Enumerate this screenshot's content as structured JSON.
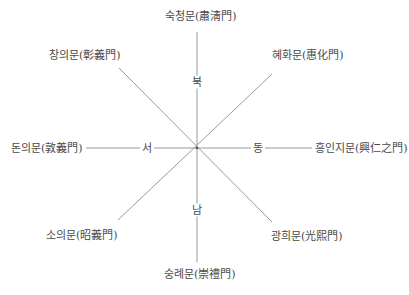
{
  "diagram": {
    "title": "",
    "line_color": "#9a9a9a",
    "center": {
      "x": 197,
      "y": 148
    },
    "directions": {
      "north": "북",
      "south": "남",
      "east": "동",
      "west": "서"
    },
    "gates": {
      "north": "숙청문(肅淸門)",
      "northeast": "혜화문(惠化門)",
      "east": "흥인지문(興仁之門)",
      "southeast": "광희문(光熙門)",
      "south": "숭례문(崇禮門)",
      "southwest": "소의문(昭義門)",
      "west": "돈의문(敦義門)",
      "northwest": "창의문(彰義門)"
    }
  }
}
